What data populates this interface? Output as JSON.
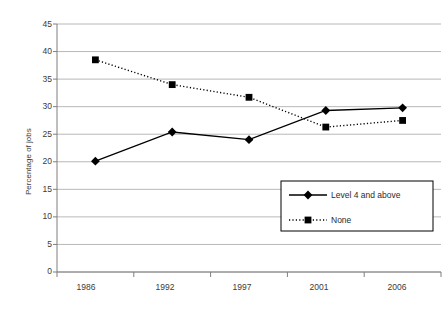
{
  "chart_data": {
    "type": "line",
    "title": "",
    "xlabel": "",
    "ylabel": "Percentage of jobs",
    "categories": [
      "1986",
      "1992",
      "1997",
      "2001",
      "2006"
    ],
    "ylim": [
      0,
      45
    ],
    "ytick_step": 5,
    "yticks": [
      "45",
      "40",
      "35",
      "30",
      "25",
      "20",
      "15",
      "10",
      "5",
      "0"
    ],
    "grid": true,
    "legend_position": "inside-right",
    "series": [
      {
        "name": "Level 4 and above",
        "marker": "diamond",
        "line_style": "solid",
        "color": "#000000",
        "values": [
          20.1,
          25.4,
          24.0,
          29.3,
          29.8
        ]
      },
      {
        "name": "None",
        "marker": "square",
        "line_style": "dotted",
        "color": "#000000",
        "values": [
          38.5,
          34.0,
          31.7,
          26.3,
          27.5
        ]
      }
    ]
  },
  "axes": {
    "y_title": "Percentage of jobs"
  },
  "legend": {
    "entries": [
      {
        "label": "Level 4 and above"
      },
      {
        "label": "None"
      }
    ]
  },
  "colors": {
    "series": "#000000",
    "grid": "#a6a6a6",
    "axis": "#7f7f7f",
    "text": "#3b3b3b",
    "background": "#ffffff"
  }
}
